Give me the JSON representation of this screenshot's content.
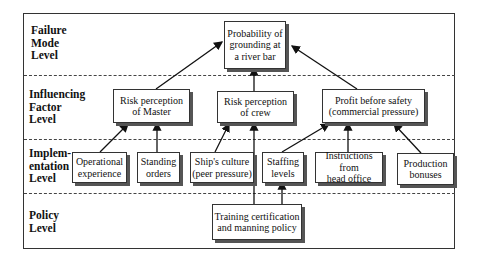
{
  "levels": [
    {
      "id": "failure",
      "label": "Failure\nMode\nLevel"
    },
    {
      "id": "influencing",
      "label": "Influencing\nFactor\nLevel"
    },
    {
      "id": "implementation",
      "label": "Implem-\nentation\nLevel"
    },
    {
      "id": "policy",
      "label": "Policy\nLevel"
    }
  ],
  "nodes": {
    "grounding": "Probability of\ngrounding at\na river bar",
    "risk_master": "Risk perception\nof Master",
    "risk_crew": "Risk perception\nof crew",
    "profit": "Profit before safety\n(commercial pressure)",
    "operational": "Operational\nexperience",
    "standing": "Standing\norders",
    "culture": "Ship's culture\n(peer pressure)",
    "staffing": "Staffing\nlevels",
    "instructions": "Instructions from\nhead office",
    "bonuses": "Production\nbonuses",
    "training": "Training certification\nand manning policy"
  },
  "edges": [
    [
      "risk_master",
      "grounding"
    ],
    [
      "risk_crew",
      "grounding"
    ],
    [
      "profit",
      "grounding"
    ],
    [
      "operational",
      "risk_master"
    ],
    [
      "standing",
      "risk_master"
    ],
    [
      "culture",
      "risk_crew"
    ],
    [
      "training",
      "risk_crew"
    ],
    [
      "staffing",
      "profit"
    ],
    [
      "instructions",
      "profit"
    ],
    [
      "bonuses",
      "profit"
    ],
    [
      "training",
      "staffing"
    ]
  ]
}
